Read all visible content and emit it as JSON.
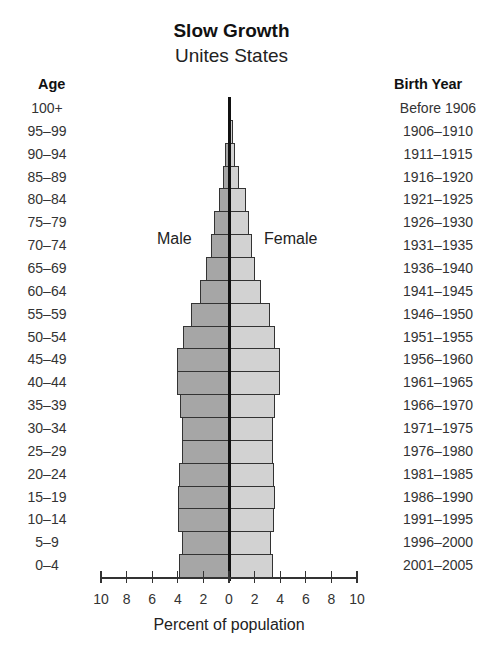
{
  "chart_data": {
    "type": "bar",
    "subtype": "population-pyramid",
    "title": "Slow Growth",
    "subtitle": "Unites States",
    "xlabel": "Percent of population",
    "ylabel_left": "Age",
    "ylabel_right": "Birth Year",
    "xlim": [
      -10,
      10
    ],
    "x_tick_labels": [
      "10",
      "8",
      "6",
      "4",
      "2",
      "0",
      "2",
      "4",
      "6",
      "8",
      "10"
    ],
    "grid": false,
    "legend": [
      "Male",
      "Female"
    ],
    "categories": [
      "100+",
      "95–99",
      "90–94",
      "85–89",
      "80–84",
      "75–79",
      "70–74",
      "65–69",
      "60–64",
      "55–59",
      "50–54",
      "45–49",
      "40–44",
      "35–39",
      "30–34",
      "25–29",
      "20–24",
      "15–19",
      "10–14",
      "5–9",
      "0–4"
    ],
    "birth_years": [
      "Before 1906",
      "1906–1910",
      "1911–1915",
      "1916–1920",
      "1921–1925",
      "1926–1930",
      "1931–1935",
      "1936–1940",
      "1941–1945",
      "1946–1950",
      "1951–1955",
      "1956–1960",
      "1961–1965",
      "1966–1970",
      "1971–1975",
      "1976–1980",
      "1981–1985",
      "1986–1990",
      "1991–1995",
      "1996–2000",
      "2001–2005"
    ],
    "series": [
      {
        "name": "Male",
        "color": "#a6a6a6",
        "values": [
          0.05,
          0.1,
          0.3,
          0.5,
          0.8,
          1.2,
          1.4,
          1.8,
          2.3,
          3.0,
          3.6,
          4.1,
          4.1,
          3.8,
          3.7,
          3.7,
          3.9,
          4.0,
          4.0,
          3.7,
          3.9
        ]
      },
      {
        "name": "Female",
        "color": "#d2d2d2",
        "values": [
          0.1,
          0.3,
          0.5,
          0.8,
          1.3,
          1.6,
          1.8,
          2.0,
          2.5,
          3.2,
          3.6,
          4.0,
          4.0,
          3.6,
          3.4,
          3.4,
          3.5,
          3.6,
          3.5,
          3.3,
          3.4
        ]
      }
    ]
  },
  "labels": {
    "title": "Slow Growth",
    "subtitle": "Unites States",
    "age_header": "Age",
    "birth_header": "Birth Year",
    "male": "Male",
    "female": "Female",
    "xlabel": "Percent of population"
  }
}
